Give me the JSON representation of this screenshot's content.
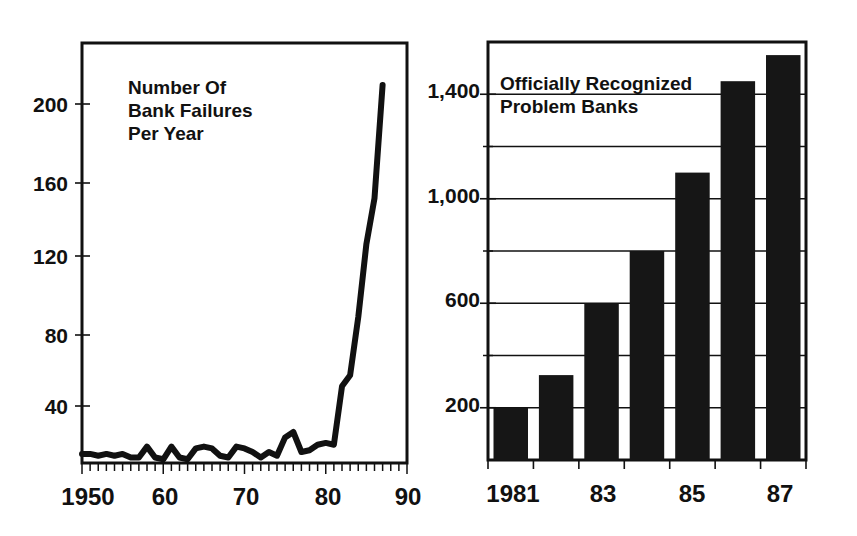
{
  "page": {
    "background": "#ffffff",
    "ink_color": "#111111",
    "bar_color": "#161616",
    "figure_count": 2
  },
  "chart_data": [
    {
      "id": "bank-failures-per-year",
      "type": "line",
      "title": "Number Of\nBank Failures\nPer Year",
      "title_lines": [
        "Number Of",
        "Bank Failures",
        "Per Year"
      ],
      "xlabel": "",
      "ylabel": "",
      "grid": false,
      "legend": "none",
      "xlim": [
        1950,
        1990
      ],
      "ylim": [
        0,
        230
      ],
      "yticks": [
        40,
        80,
        120,
        160,
        200
      ],
      "ytick_labels": [
        "40",
        "80",
        "120",
        "160",
        "200"
      ],
      "xticks": [
        1950,
        1960,
        1970,
        1980,
        1990
      ],
      "xtick_labels": [
        "1950",
        "60",
        "70",
        "80",
        "90"
      ],
      "minor_xtick_interval": 1,
      "x": [
        1950,
        1951,
        1952,
        1953,
        1954,
        1955,
        1956,
        1957,
        1958,
        1959,
        1960,
        1961,
        1962,
        1963,
        1964,
        1965,
        1966,
        1967,
        1968,
        1969,
        1970,
        1971,
        1972,
        1973,
        1974,
        1975,
        1976,
        1977,
        1978,
        1979,
        1980,
        1981,
        1982,
        1983,
        1984,
        1985,
        1986,
        1987
      ],
      "values": [
        5,
        5,
        4,
        5,
        4,
        5,
        3,
        3,
        9,
        3,
        2,
        9,
        3,
        2,
        8,
        9,
        8,
        4,
        3,
        9,
        8,
        6,
        3,
        6,
        4,
        14,
        17,
        6,
        7,
        10,
        11,
        10,
        42,
        48,
        80,
        120,
        145,
        207
      ],
      "peak": {
        "year": 1987,
        "value": 207
      },
      "series_color": "#111111"
    },
    {
      "id": "officially-recognized-problem-banks",
      "type": "bar",
      "title": "Officially Recognized\nProblem Banks",
      "title_lines": [
        "Officially Recognized",
        "Problem Banks"
      ],
      "xlabel": "",
      "ylabel": "",
      "grid": true,
      "legend": "none",
      "ylim": [
        0,
        1600
      ],
      "yticks": [
        200,
        600,
        1000,
        1400
      ],
      "ytick_labels": [
        "200",
        "600",
        "1,000",
        "1,400"
      ],
      "gridlines": [
        200,
        400,
        600,
        800,
        1000,
        1200,
        1400
      ],
      "categories": [
        "1981",
        "1982",
        "1983",
        "1984",
        "1985",
        "1986",
        "1987"
      ],
      "xtick_labels": [
        "1981",
        "",
        "83",
        "",
        "85",
        "",
        "87"
      ],
      "values": [
        200,
        325,
        600,
        800,
        1100,
        1450,
        1550
      ],
      "bar_color": "#161616"
    }
  ]
}
